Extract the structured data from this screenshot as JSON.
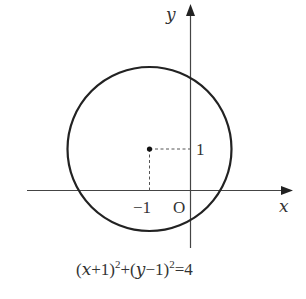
{
  "diagram": {
    "type": "circle-on-coordinate-plane",
    "axes": {
      "x_label": "x",
      "y_label": "y",
      "origin_label": "O"
    },
    "circle": {
      "center": [
        -1,
        1
      ],
      "radius": 2
    },
    "tick_labels": {
      "x_center": "−1",
      "y_center": "1"
    },
    "equation": {
      "lhs_part1": "(",
      "var1": "x",
      "op1": "+1)",
      "exp1": "2",
      "plus": "+(",
      "var2": "y",
      "op2": "−1)",
      "exp2": "2",
      "rhs": "=4",
      "full_text": "(x+1)²+(y−1)²=4"
    },
    "colors": {
      "stroke": "#222222",
      "axis": "#444444",
      "dash": "#555555",
      "text": "#333333"
    }
  }
}
